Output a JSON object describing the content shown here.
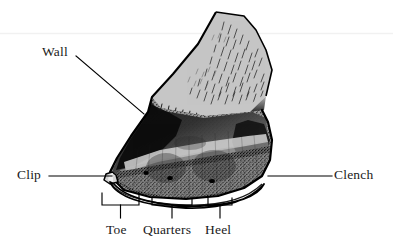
{
  "figure": {
    "background_color": "#ffffff",
    "ink_color": "#000000",
    "hoof_light_color": "#c9c9c9",
    "hoof_mid_color": "#8a8a8a",
    "hoof_dark_color": "#151515",
    "scan_line_color": "#f2f2f2"
  },
  "labels": {
    "wall": "Wall",
    "clip": "Clip",
    "clench": "Clench",
    "toe": "Toe",
    "quarters": "Quarters",
    "heel": "Heel"
  },
  "leaders": [
    {
      "name": "wall",
      "from": [
        76,
        55
      ],
      "to": [
        144,
        114
      ]
    },
    {
      "name": "clip",
      "from": [
        49,
        176
      ],
      "to": [
        112,
        176
      ]
    },
    {
      "name": "clench",
      "from": [
        332,
        176
      ],
      "to": [
        268,
        176
      ]
    }
  ],
  "brackets": [
    {
      "name": "toe",
      "x_start": 102,
      "x_end": 139,
      "top_y": 193,
      "bar_y": 205,
      "stem_y": 218,
      "label": "Toe"
    },
    {
      "name": "quarters",
      "x_start": 152,
      "x_end": 192,
      "top_y": 198,
      "bar_y": 205,
      "stem_y": 218,
      "label": "Quarters"
    },
    {
      "name": "heel",
      "x_start": 208,
      "x_end": 232,
      "top_y": 198,
      "bar_y": 205,
      "stem_y": 218,
      "label": "Heel"
    }
  ],
  "annotations": {
    "nail_holes": 3,
    "scan_artifact_line_y": 33
  }
}
